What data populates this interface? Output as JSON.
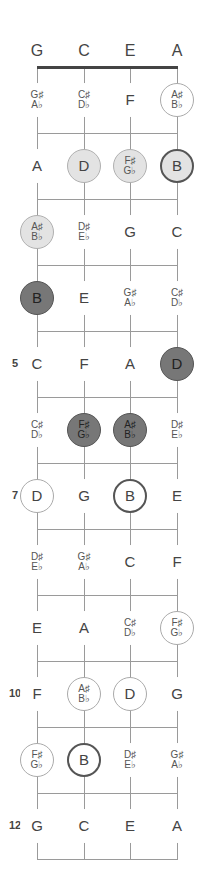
{
  "tuning": [
    "G",
    "C",
    "E",
    "A"
  ],
  "layout": {
    "string_x": [
      37,
      84,
      130,
      177
    ],
    "nut_y": 67,
    "fret_spacing": 66,
    "open_label_y": 52
  },
  "fret_numbers": [
    {
      "fret": 5,
      "label": "5"
    },
    {
      "fret": 7,
      "label": "7"
    },
    {
      "fret": 10,
      "label": "10"
    },
    {
      "fret": 12,
      "label": "12"
    }
  ],
  "frets": [
    {
      "fret": 1,
      "notes": [
        {
          "sharp": "G♯",
          "flat": "A♭",
          "style": "plain"
        },
        {
          "sharp": "C♯",
          "flat": "D♭",
          "style": "plain"
        },
        {
          "name": "F",
          "style": "plain"
        },
        {
          "sharp": "A♯",
          "flat": "B♭",
          "style": "thin"
        }
      ]
    },
    {
      "fret": 2,
      "notes": [
        {
          "name": "A",
          "style": "plain"
        },
        {
          "name": "D",
          "style": "light"
        },
        {
          "sharp": "F♯",
          "flat": "G♭",
          "style": "light"
        },
        {
          "name": "B",
          "style": "lightthick"
        }
      ]
    },
    {
      "fret": 3,
      "notes": [
        {
          "sharp": "A♯",
          "flat": "B♭",
          "style": "light"
        },
        {
          "sharp": "D♯",
          "flat": "E♭",
          "style": "plain"
        },
        {
          "name": "G",
          "style": "plain"
        },
        {
          "name": "C",
          "style": "plain"
        }
      ]
    },
    {
      "fret": 4,
      "notes": [
        {
          "name": "B",
          "style": "dark"
        },
        {
          "name": "E",
          "style": "plain"
        },
        {
          "sharp": "G♯",
          "flat": "A♭",
          "style": "plain"
        },
        {
          "sharp": "C♯",
          "flat": "D♭",
          "style": "plain"
        }
      ]
    },
    {
      "fret": 5,
      "notes": [
        {
          "name": "C",
          "style": "plain"
        },
        {
          "name": "F",
          "style": "plain"
        },
        {
          "name": "A",
          "style": "plain"
        },
        {
          "name": "D",
          "style": "dark"
        }
      ]
    },
    {
      "fret": 6,
      "notes": [
        {
          "sharp": "C♯",
          "flat": "D♭",
          "style": "plain"
        },
        {
          "sharp": "F♯",
          "flat": "G♭",
          "style": "dark"
        },
        {
          "sharp": "A♯",
          "flat": "B♭",
          "style": "dark"
        },
        {
          "sharp": "D♯",
          "flat": "E♭",
          "style": "plain"
        }
      ]
    },
    {
      "fret": 7,
      "notes": [
        {
          "name": "D",
          "style": "thin"
        },
        {
          "name": "G",
          "style": "plain"
        },
        {
          "name": "B",
          "style": "thick"
        },
        {
          "name": "E",
          "style": "plain"
        }
      ]
    },
    {
      "fret": 8,
      "notes": [
        {
          "sharp": "D♯",
          "flat": "E♭",
          "style": "plain"
        },
        {
          "sharp": "G♯",
          "flat": "A♭",
          "style": "plain"
        },
        {
          "name": "C",
          "style": "plain"
        },
        {
          "name": "F",
          "style": "plain"
        }
      ]
    },
    {
      "fret": 9,
      "notes": [
        {
          "name": "E",
          "style": "plain"
        },
        {
          "name": "A",
          "style": "plain"
        },
        {
          "sharp": "C♯",
          "flat": "D♭",
          "style": "plain"
        },
        {
          "sharp": "F♯",
          "flat": "G♭",
          "style": "thin"
        }
      ]
    },
    {
      "fret": 10,
      "notes": [
        {
          "name": "F",
          "style": "plain"
        },
        {
          "sharp": "A♯",
          "flat": "B♭",
          "style": "thin"
        },
        {
          "name": "D",
          "style": "thin"
        },
        {
          "name": "G",
          "style": "plain"
        }
      ]
    },
    {
      "fret": 11,
      "notes": [
        {
          "sharp": "F♯",
          "flat": "G♭",
          "style": "thin"
        },
        {
          "name": "B",
          "style": "thick"
        },
        {
          "sharp": "D♯",
          "flat": "E♭",
          "style": "plain"
        },
        {
          "sharp": "G♯",
          "flat": "A♭",
          "style": "plain"
        }
      ]
    },
    {
      "fret": 12,
      "notes": [
        {
          "name": "G",
          "style": "plain"
        },
        {
          "name": "C",
          "style": "plain"
        },
        {
          "name": "E",
          "style": "plain"
        },
        {
          "name": "A",
          "style": "plain"
        }
      ]
    }
  ]
}
